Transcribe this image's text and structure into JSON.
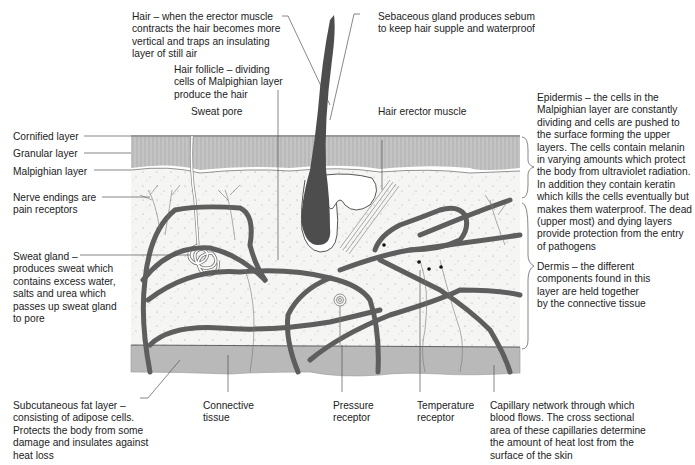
{
  "colors": {
    "background": "#ffffff",
    "epidermis": "#bdbdbd",
    "dermis": "#f4f4f2",
    "fat_layer": "#b9b9b9",
    "vessel": "#5e5e5e",
    "hair": "#4d4d4d",
    "text": "#222222",
    "leader": "#555555"
  },
  "labels": {
    "hair": "Hair – when the erector muscle\ncontracts the hair becomes more\nvertical and traps an insulating\nlayer of still air",
    "sebaceous": "Sebaceous gland produces sebum\nto keep hair supple and waterproof",
    "hair_follicle": "Hair follicle – dividing\ncells of Malpighian layer\nproduce the hair",
    "sweat_pore": "Sweat pore",
    "hair_erector": "Hair erector muscle",
    "cornified": "Cornified layer",
    "granular": "Granular layer",
    "malpighian": "Malpighian layer",
    "nerve_endings": "Nerve endings are\npain receptors",
    "sweat_gland": "Sweat gland –\nproduces sweat which\ncontains excess water,\nsalts and urea which\npasses up sweat gland\nto pore",
    "epidermis": "Epidermis – the cells in the\nMalpighian layer are constantly\ndividing and cells are pushed to\nthe surface forming the upper\nlayers. The cells contain melanin\nin varying amounts which protect\nthe body from ultraviolet radiation.\nIn addition they contain keratin\nwhich kills the cells eventually but\nmakes them waterproof. The dead\n(upper most) and dying layers\nprovide protection from the entry\nof pathogens",
    "dermis": "Dermis – the different\ncomponents found in this\nlayer are held together\nby the connective tissue",
    "subcutaneous": "Subcutaneous fat layer –\nconsisting of adipose cells.\nProtects the body from some\ndamage and insulates against\nheat loss",
    "connective": "Connective\ntissue",
    "pressure": "Pressure\nreceptor",
    "temperature": "Temperature\nreceptor",
    "capillary": "Capillary network through which\nblood flows. The cross sectional\narea of these capillaries determine\nthe amount of heat lost from the\nsurface of the skin"
  }
}
